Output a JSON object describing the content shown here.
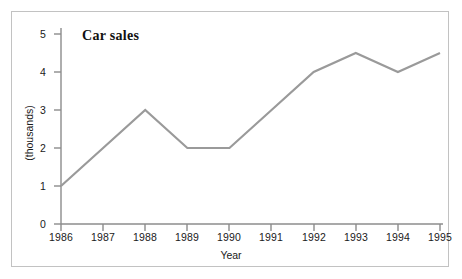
{
  "figure": {
    "background_color": "#ffffff",
    "frame_color": "#c2c2c2",
    "axis_color": "#8c8c8c",
    "text_color": "#1a1a1a"
  },
  "chart_data": {
    "type": "line",
    "title": "Car sales",
    "xlabel": "Year",
    "ylabel": "(thousands)",
    "categories": [
      "1986",
      "1987",
      "1988",
      "1989",
      "1990",
      "1991",
      "1992",
      "1993",
      "1994",
      "1995"
    ],
    "values": [
      1,
      2,
      3,
      2,
      2,
      3,
      4,
      4.5,
      4,
      4.5
    ],
    "series": [
      {
        "name": "Car sales",
        "color": "#9a9a9a",
        "values": [
          1,
          2,
          3,
          2,
          2,
          3,
          4,
          4.5,
          4,
          4.5
        ]
      }
    ],
    "ylim": [
      0,
      5
    ],
    "yticks": [
      "0",
      "1",
      "2",
      "3",
      "4",
      "5"
    ],
    "ytick_values": [
      0,
      1,
      2,
      3,
      4,
      5
    ],
    "xlim": [
      "1986",
      "1995"
    ],
    "grid": false,
    "legend": false,
    "markers": false,
    "line_width": 2
  }
}
